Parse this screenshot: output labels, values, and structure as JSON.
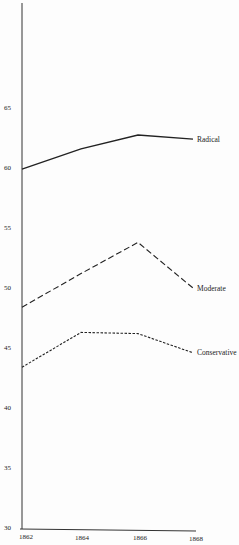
{
  "chart_data": {
    "type": "line",
    "title": "",
    "xlabel": "",
    "ylabel": "",
    "x": [
      1862,
      1864,
      1866,
      1868
    ],
    "x_tick_labels": [
      "1862",
      "1864",
      "1866",
      "1868"
    ],
    "y_tick_labels": [
      "30",
      "35",
      "40",
      "45",
      "50",
      "55",
      "60",
      "65"
    ],
    "ylim": [
      30,
      69.5
    ],
    "grid": false,
    "legend_position": "inline labels at right end of lines",
    "series": [
      {
        "name": "Radical",
        "style": "solid",
        "values": [
          59.9,
          61.6,
          62.75,
          62.4
        ]
      },
      {
        "name": "Moderate",
        "style": "long-dash",
        "values": [
          48.4,
          51.2,
          53.8,
          50.0
        ]
      },
      {
        "name": "Conservative",
        "style": "short-dash",
        "values": [
          43.4,
          46.3,
          46.2,
          44.6
        ]
      }
    ]
  }
}
